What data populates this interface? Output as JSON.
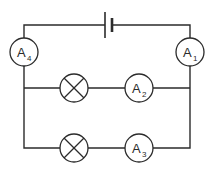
{
  "diagram": {
    "colors": {
      "stroke": "#2b2b2b",
      "background": "#ffffff"
    },
    "cell": {
      "type": "cell"
    },
    "ammeters": [
      {
        "id": "A1",
        "letter": "A",
        "sub": "1"
      },
      {
        "id": "A2",
        "letter": "A",
        "sub": "2"
      },
      {
        "id": "A3",
        "letter": "A",
        "sub": "3"
      },
      {
        "id": "A4",
        "letter": "A",
        "sub": "4"
      }
    ],
    "lamps": [
      {
        "id": "lamp-1",
        "branch": "upper"
      },
      {
        "id": "lamp-2",
        "branch": "lower"
      }
    ]
  }
}
